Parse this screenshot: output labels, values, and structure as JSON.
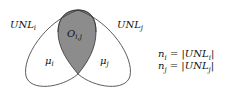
{
  "diagram": {
    "type": "venn",
    "sets": [
      {
        "label": "UNL_i",
        "label_text": "UNL",
        "sub": "i",
        "region_label": "μ",
        "region_sub": "i"
      },
      {
        "label": "UNL_j",
        "label_text": "UNL",
        "sub": "j",
        "region_label": "μ",
        "region_sub": "j"
      }
    ],
    "intersection": {
      "label_text": "O",
      "sub": "i,j",
      "fill": "#8c8c8c"
    },
    "equations": [
      {
        "lhs": "n",
        "lhs_sub": "i",
        "rhs_text": " = |UNL",
        "rhs_sub": "i",
        "tail": "|"
      },
      {
        "lhs": "n",
        "lhs_sub": "j",
        "rhs_text": " = |UNL",
        "rhs_sub": "j",
        "tail": "|"
      }
    ],
    "colors": {
      "stroke": "#333333",
      "shade": "#8c8c8c",
      "background": "#ffffff"
    }
  }
}
